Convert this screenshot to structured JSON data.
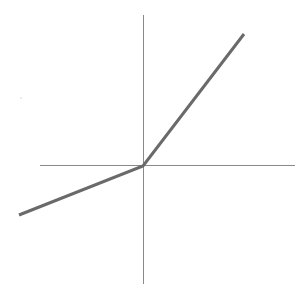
{
  "chart_data": {
    "type": "line",
    "title": "",
    "xlabel": "",
    "ylabel": "",
    "grid": false,
    "legend": null,
    "description": "Piecewise linear function through the origin (leaky-ReLU style): shallow positive slope for x<0, steep positive slope for x>0",
    "axes": {
      "style": "centered-cross",
      "color": "#8a8a8a",
      "x_extent": [
        -1.03,
        1.52
      ],
      "y_extent": [
        -1.18,
        1.51
      ]
    },
    "xlim": [
      -1.24,
      1.52
    ],
    "ylim": [
      -1.18,
      1.51
    ],
    "series": [
      {
        "name": "f(x)",
        "color": "#6a6a6a",
        "x": [
          -1.24,
          0,
          1.01
        ],
        "y": [
          -0.49,
          0,
          1.32
        ]
      }
    ],
    "slopes": {
      "negative_side": 0.4,
      "positive_side": 1.3
    }
  },
  "render": {
    "px_per_unit": 100,
    "origin_px": [
      143,
      166
    ],
    "line_width": 3,
    "axis_width": 1,
    "artifact_dot": {
      "x": 21,
      "y": 98,
      "color": "#d8d8d8"
    }
  }
}
